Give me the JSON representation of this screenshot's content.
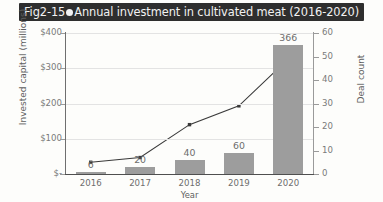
{
  "title": {
    "prefix": "Fig2-15",
    "text": "Annual investment in cultivated meat (2016-2020)",
    "bar_color": "#2e2e2e",
    "text_color": "#f2f2f2"
  },
  "chart_data": {
    "type": "bar",
    "title": "Annual investment in cultivated meat (2016-2020)",
    "categories": [
      "2016",
      "2017",
      "2018",
      "2019",
      "2020"
    ],
    "xlabel": "Year",
    "ylabel": "Invested capital (millions)",
    "y2label": "Deal count",
    "ylim": [
      0,
      400
    ],
    "y2lim": [
      0,
      60
    ],
    "yticks": [
      "$-",
      "$100",
      "$200",
      "$300",
      "$400"
    ],
    "ytick_values": [
      0,
      100,
      200,
      300,
      400
    ],
    "y2ticks": [
      "0",
      "10",
      "20",
      "30",
      "40",
      "50",
      "60"
    ],
    "y2tick_values": [
      0,
      10,
      20,
      30,
      40,
      50,
      60
    ],
    "grid": true,
    "legend": "none",
    "series": [
      {
        "name": "Invested capital (millions)",
        "kind": "bar",
        "axis": "left",
        "color": "#9d9d9d",
        "values": [
          6,
          20,
          40,
          60,
          366
        ],
        "labels": [
          "6",
          "20",
          "40",
          "60",
          "366"
        ]
      },
      {
        "name": "Deal count",
        "kind": "line",
        "axis": "right",
        "color": "#3a3a3a",
        "marker": "square",
        "values": [
          5,
          7,
          21,
          29,
          49
        ],
        "labels": [
          "",
          "",
          "",
          "",
          ""
        ]
      }
    ]
  }
}
